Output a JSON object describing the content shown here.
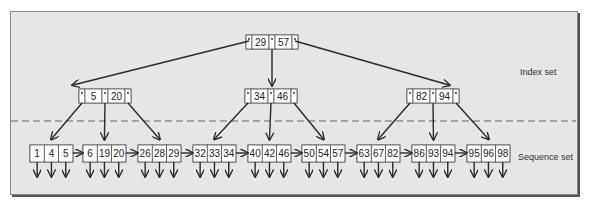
{
  "labels": {
    "index_set": "Index set",
    "sequence_set": "Sequence set"
  },
  "index_set": {
    "root": {
      "keys": [
        "29",
        "57"
      ]
    },
    "level2": [
      {
        "keys": [
          "5",
          "20"
        ]
      },
      {
        "keys": [
          "34",
          "46"
        ]
      },
      {
        "keys": [
          "82",
          "94"
        ]
      }
    ]
  },
  "sequence_set": [
    {
      "keys": [
        "1",
        "4",
        "5"
      ]
    },
    {
      "keys": [
        "6",
        "19",
        "20"
      ]
    },
    {
      "keys": [
        "26",
        "28",
        "29"
      ]
    },
    {
      "keys": [
        "32",
        "33",
        "34"
      ]
    },
    {
      "keys": [
        "40",
        "42",
        "46"
      ]
    },
    {
      "keys": [
        "50",
        "54",
        "57"
      ]
    },
    {
      "keys": [
        "63",
        "67",
        "82"
      ]
    },
    {
      "keys": [
        "86",
        "93",
        "94"
      ]
    },
    {
      "keys": [
        "95",
        "96",
        "98"
      ]
    }
  ],
  "colors": {
    "background": "#e6e6e6",
    "node_fill": "#ffffff",
    "line": "#2a2a2a",
    "divider": "#666666"
  }
}
